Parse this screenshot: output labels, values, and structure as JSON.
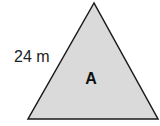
{
  "diagram": {
    "shape": "triangle",
    "side_label": "24 m",
    "region_label": "A",
    "fill": "#dadada",
    "stroke": "#1a1a1a"
  }
}
